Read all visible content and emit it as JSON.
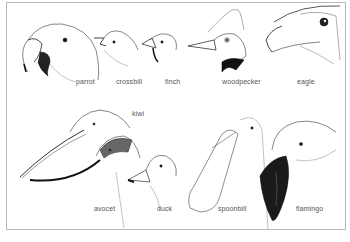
{
  "figure": {
    "labels": {
      "parrot": "parrot",
      "crossbill": "crossbill",
      "finch": "finch",
      "woodpecker": "woodpecker",
      "eagle": "eagle",
      "kiwi": "kiwi",
      "avocet": "avocet",
      "duck": "duck",
      "spoonbill": "spoonbill",
      "flamingo": "flamingo"
    }
  }
}
